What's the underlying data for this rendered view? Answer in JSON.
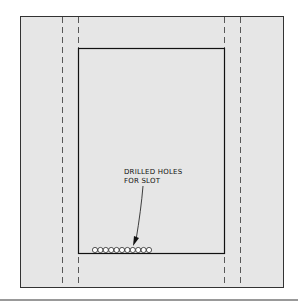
{
  "diagram": {
    "annotation": {
      "line1": "DRILLED HOLES",
      "line2": "FOR SLOT"
    },
    "hole_count": 11,
    "colors": {
      "panel_fill": "#e6e6e6",
      "line": "#222222",
      "hole_fill": "#ffffff"
    }
  }
}
